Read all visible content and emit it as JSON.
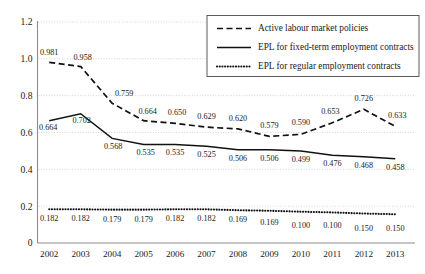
{
  "chart_data": {
    "type": "line",
    "title": "",
    "subtitle": "",
    "xlabel": "",
    "ylabel": "",
    "grid": true,
    "legend_position": "top-right",
    "categories": [
      "2002",
      "2003",
      "2004",
      "2005",
      "2006",
      "2007",
      "2008",
      "2009",
      "2010",
      "2011",
      "2012",
      "2013"
    ],
    "ylim": [
      0,
      1.2
    ],
    "yticks": [
      "0",
      "0.2",
      "0.4",
      "0.6",
      "0.8",
      "1.0",
      "1.2"
    ],
    "ytick_values": [
      0,
      0.2,
      0.4,
      0.6,
      0.8,
      1.0,
      1.2
    ],
    "series": [
      {
        "name": "Active labour market policies",
        "style": "dashed",
        "values": [
          0.981,
          0.958,
          0.759,
          0.664,
          0.65,
          0.629,
          0.62,
          0.579,
          0.59,
          0.653,
          0.726,
          0.633
        ],
        "labels": [
          "0.981",
          "0.958",
          "0.759",
          "0.664",
          "0.650",
          "0.629",
          "0.620",
          "0.579",
          "0.590",
          "0.653",
          "0.726",
          "0.633"
        ]
      },
      {
        "name": "EPL for fixed-term employment contracts",
        "style": "solid",
        "values": [
          0.664,
          0.702,
          0.568,
          0.535,
          0.535,
          0.525,
          0.506,
          0.506,
          0.499,
          0.476,
          0.468,
          0.458
        ],
        "labels": [
          "0.664",
          "0.702",
          "0.568",
          "0.535",
          "0.535",
          "0.525",
          "0.506",
          "0.506",
          "0.499",
          "0.476",
          "0.468",
          "0.458"
        ]
      },
      {
        "name": "EPL for regular employment contracts",
        "style": "dotted",
        "values": [
          0.182,
          0.182,
          0.179,
          0.179,
          0.182,
          0.182,
          0.169,
          0.169,
          0.1,
          0.1,
          0.15,
          0.15
        ],
        "plot_values": [
          0.183,
          0.183,
          0.181,
          0.181,
          0.183,
          0.183,
          0.178,
          0.175,
          0.17,
          0.166,
          0.16,
          0.156
        ],
        "labels": [
          "0.182",
          "0.182",
          "0.179",
          "0.179",
          "0.182",
          "0.182",
          "0.169",
          "0.169",
          "0.100",
          "0.100",
          "0.150",
          "0.150"
        ]
      }
    ],
    "colors": {
      "line": "#111111",
      "grid": "#c9c9c9",
      "axis": "#8c8c8c",
      "text": "#1a1a1a",
      "legend_border": "#4a4a4a",
      "background": "#ffffff"
    },
    "label_offsets": {
      "series0": [
        {
          "dx": 0,
          "dy": -7
        },
        {
          "dx": 2,
          "dy": -7
        },
        {
          "dx": 12,
          "dy": -7
        },
        {
          "dx": 4,
          "dy": -7
        },
        {
          "dx": 2,
          "dy": -8
        },
        {
          "dx": 0,
          "dy": -8
        },
        {
          "dx": 0,
          "dy": -8
        },
        {
          "dx": 0,
          "dy": -8
        },
        {
          "dx": 0,
          "dy": -9
        },
        {
          "dx": -2,
          "dy": -9
        },
        {
          "dx": 0,
          "dy": -8
        },
        {
          "dx": 2,
          "dy": -8
        }
      ],
      "series1": [
        {
          "dx": -1,
          "dy": 9
        },
        {
          "dx": 1,
          "dy": 9
        },
        {
          "dx": 1,
          "dy": 11
        },
        {
          "dx": 2,
          "dy": 11
        },
        {
          "dx": 0,
          "dy": 11
        },
        {
          "dx": 0,
          "dy": 11
        },
        {
          "dx": 0,
          "dy": 11
        },
        {
          "dx": 0,
          "dy": 11
        },
        {
          "dx": 0,
          "dy": 11
        },
        {
          "dx": 0,
          "dy": 11
        },
        {
          "dx": 0,
          "dy": 11
        },
        {
          "dx": 0,
          "dy": 11
        }
      ],
      "series2": [
        {
          "dx": 0,
          "dy": 12
        },
        {
          "dx": 0,
          "dy": 12
        },
        {
          "dx": 0,
          "dy": 12
        },
        {
          "dx": 0,
          "dy": 12
        },
        {
          "dx": 0,
          "dy": 12
        },
        {
          "dx": 0,
          "dy": 12
        },
        {
          "dx": 0,
          "dy": 12
        },
        {
          "dx": 0,
          "dy": 14
        },
        {
          "dx": 0,
          "dy": 16
        },
        {
          "dx": 0,
          "dy": 16
        },
        {
          "dx": 0,
          "dy": 17
        },
        {
          "dx": 0,
          "dy": 17
        }
      ]
    }
  },
  "legend": {
    "items": [
      {
        "label": "Active labour market policies",
        "style": "dashed"
      },
      {
        "label": "EPL for fixed-term employment contracts",
        "style": "solid"
      },
      {
        "label": "EPL for regular employment contracts",
        "style": "dotted"
      }
    ]
  }
}
